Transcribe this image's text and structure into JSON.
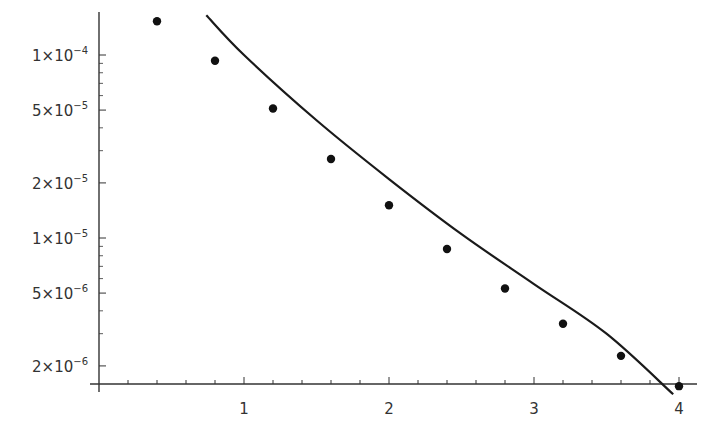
{
  "chart_data": {
    "type": "scatter",
    "title": "",
    "xlabel": "",
    "ylabel": "",
    "yscale": "log",
    "xlim": [
      0,
      4.05
    ],
    "ylim": [
      1.6e-06,
      0.0002
    ],
    "grid": false,
    "legend": null,
    "x_ticks": [
      1,
      2,
      3,
      4
    ],
    "x_tick_labels": [
      "1",
      "2",
      "3",
      "4"
    ],
    "y_ticks": [
      0.0001,
      5e-05,
      2e-05,
      1e-05,
      5e-06,
      2e-06
    ],
    "y_tick_labels": [
      {
        "mant": "1",
        "exp": "−4"
      },
      {
        "mant": "5",
        "exp": "−5"
      },
      {
        "mant": "2",
        "exp": "−5"
      },
      {
        "mant": "1",
        "exp": "−5"
      },
      {
        "mant": "5",
        "exp": "−6"
      },
      {
        "mant": "2",
        "exp": "−6"
      }
    ],
    "series": [
      {
        "name": "data points",
        "style": "markers",
        "x": [
          0.4,
          0.8,
          1.2,
          1.6,
          2.0,
          2.4,
          2.8,
          3.2,
          3.6,
          4.0
        ],
        "y": [
          0.000153,
          9.3e-05,
          5.1e-05,
          2.7e-05,
          1.51e-05,
          8.7e-06,
          5.3e-06,
          3.4e-06,
          2.27e-06,
          1.55e-06
        ]
      },
      {
        "name": "fit curve",
        "style": "line",
        "x": [
          0.74,
          1.0,
          1.5,
          2.0,
          2.5,
          3.0,
          3.5,
          3.96
        ],
        "y": [
          0.000165,
          0.0001,
          4.4e-05,
          2.1e-05,
          1.05e-05,
          5.6e-06,
          3e-06,
          1.4e-06
        ]
      }
    ]
  },
  "colors": {
    "axis": "#333333",
    "marker": "#111111",
    "line": "#1a1a1a",
    "text": "#333333"
  }
}
